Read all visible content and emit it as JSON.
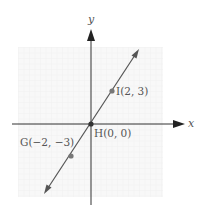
{
  "figure": {
    "axes": {
      "x_label": "x",
      "y_label": "y"
    },
    "points": [
      {
        "name": "I",
        "x": 2,
        "y": 3,
        "label": "I(2, 3)"
      },
      {
        "name": "H",
        "x": 0,
        "y": 0,
        "label": "H(0, 0)"
      },
      {
        "name": "G",
        "x": -2,
        "y": -3,
        "label": "G(−2, −3)"
      }
    ],
    "line": {
      "description": "line through G, H, I",
      "slope": 1.5
    },
    "colors": {
      "line": "#555555",
      "point": "#7a7a7a",
      "grid": "#ededed",
      "grid_bg": "#f7f7f7",
      "axis": "#333333"
    }
  }
}
